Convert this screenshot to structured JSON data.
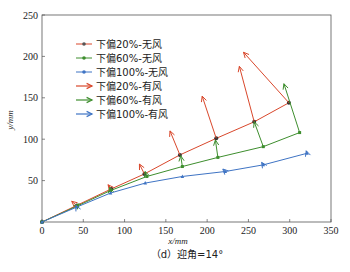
{
  "chart_data": {
    "type": "line",
    "title": "",
    "caption": "（d）迎角=14°",
    "xlabel": "x/mm",
    "ylabel": "y/mm",
    "xlim": [
      0,
      350
    ],
    "ylim": [
      0,
      250
    ],
    "xticks": [
      0,
      50,
      100,
      150,
      200,
      250,
      300,
      350
    ],
    "yticks": [
      50,
      100,
      150,
      200,
      250
    ],
    "grid": false,
    "legend_position": "upper left",
    "series": [
      {
        "name": "下偏20%-无风",
        "color": "#d9472b",
        "marker": "circle",
        "markerColor": "#333333",
        "x": [
          0,
          42,
          84,
          124,
          167,
          211,
          257,
          299
        ],
        "y": [
          0,
          20,
          40,
          58,
          81,
          101,
          121,
          144
        ]
      },
      {
        "name": "下偏60%-无风",
        "color": "#3e8e2e",
        "marker": "square",
        "markerColor": "#3e8e2e",
        "x": [
          0,
          42,
          83,
          127,
          170,
          213,
          268,
          312
        ],
        "y": [
          0,
          19,
          38,
          55,
          67,
          78,
          91,
          108
        ]
      },
      {
        "name": "下偏100%-无风",
        "color": "#3f74c4",
        "marker": "triangle",
        "markerColor": "#3f74c4",
        "x": [
          0,
          42,
          83,
          125,
          170,
          222,
          268,
          321
        ],
        "y": [
          0,
          18,
          35,
          47,
          55,
          61,
          69,
          83
        ]
      }
    ],
    "vector_series": [
      {
        "name": "下偏20%-有风",
        "color": "#d9472b",
        "vectors": [
          {
            "x0": 42,
            "y0": 20,
            "x1": 36,
            "y1": 25
          },
          {
            "x0": 84,
            "y0": 40,
            "x1": 80,
            "y1": 45
          },
          {
            "x0": 124,
            "y0": 58,
            "x1": 118,
            "y1": 70
          },
          {
            "x0": 167,
            "y0": 81,
            "x1": 155,
            "y1": 110
          },
          {
            "x0": 211,
            "y0": 101,
            "x1": 194,
            "y1": 152
          },
          {
            "x0": 257,
            "y0": 121,
            "x1": 239,
            "y1": 188
          },
          {
            "x0": 299,
            "y0": 144,
            "x1": 244,
            "y1": 205
          }
        ]
      },
      {
        "name": "下偏60%-有风",
        "color": "#3e8e2e",
        "vectors": [
          {
            "x0": 42,
            "y0": 19,
            "x1": 45,
            "y1": 22
          },
          {
            "x0": 83,
            "y0": 38,
            "x1": 82,
            "y1": 42
          },
          {
            "x0": 127,
            "y0": 55,
            "x1": 125,
            "y1": 61
          },
          {
            "x0": 170,
            "y0": 67,
            "x1": 168,
            "y1": 80
          },
          {
            "x0": 213,
            "y0": 78,
            "x1": 210,
            "y1": 99
          },
          {
            "x0": 268,
            "y0": 91,
            "x1": 257,
            "y1": 121
          },
          {
            "x0": 312,
            "y0": 108,
            "x1": 293,
            "y1": 167
          }
        ]
      },
      {
        "name": "下偏100%-有风",
        "color": "#3f74c4",
        "vectors": [
          {
            "x0": 42,
            "y0": 18,
            "x1": 41,
            "y1": 20
          },
          {
            "x0": 222,
            "y0": 61,
            "x1": 219,
            "y1": 64
          },
          {
            "x0": 268,
            "y0": 69,
            "x1": 266,
            "y1": 72
          },
          {
            "x0": 321,
            "y0": 83,
            "x1": 320,
            "y1": 86
          }
        ]
      }
    ]
  },
  "legend": {
    "items": [
      {
        "label": "下偏20%-无风",
        "color": "#d9472b",
        "kind": "line-marker"
      },
      {
        "label": "下偏60%-无风",
        "color": "#3e8e2e",
        "kind": "line-marker"
      },
      {
        "label": "下偏100%-无风",
        "color": "#3f74c4",
        "kind": "line-marker"
      },
      {
        "label": "下偏20%-有风",
        "color": "#d9472b",
        "kind": "arrow"
      },
      {
        "label": "下偏60%-有风",
        "color": "#3e8e2e",
        "kind": "arrow"
      },
      {
        "label": "下偏100%-有风",
        "color": "#3f74c4",
        "kind": "arrow"
      }
    ]
  }
}
